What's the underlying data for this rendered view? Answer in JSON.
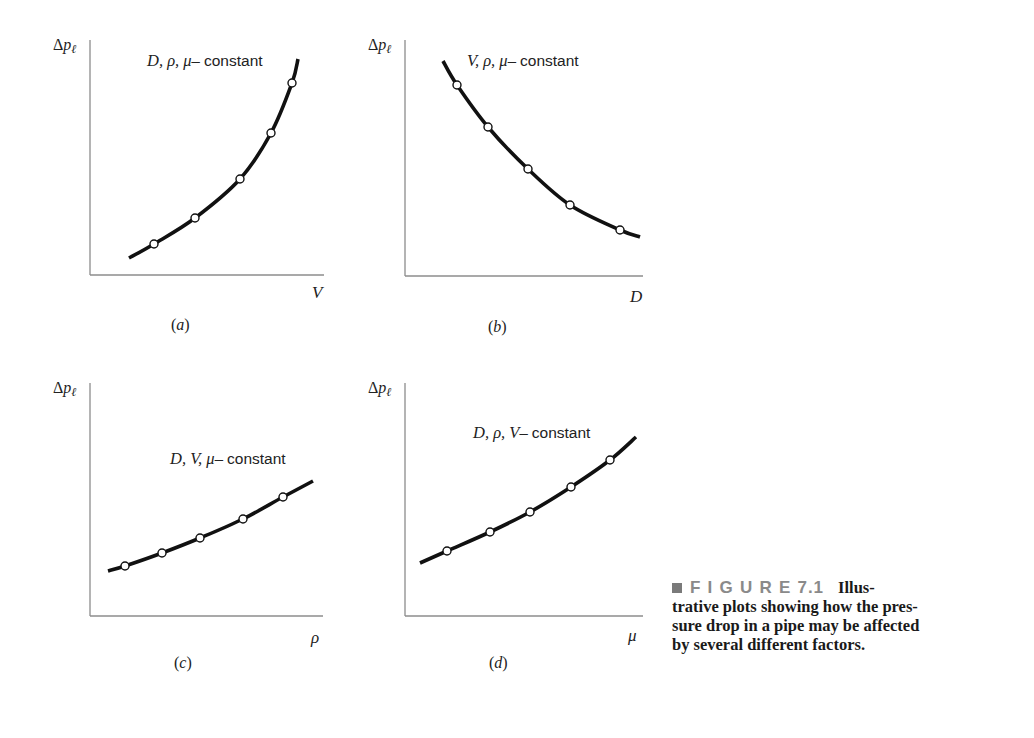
{
  "figure": {
    "label": "FIGURE",
    "number": "7.1",
    "caption_lines": [
      "Illus-",
      "trative plots showing how the pres-",
      "sure drop in a pipe may be affected",
      "by several different factors."
    ]
  },
  "style": {
    "curve_color": "#111111",
    "axis_color": "#8c8c8c",
    "marker_fill": "#ffffff",
    "caption_accent": "#8a8a8a"
  },
  "chart_data": [
    {
      "id": "a",
      "type": "line",
      "panel_label": "(a)",
      "title": "D, ρ, μ– constant",
      "title_italic": "D, ρ, μ–",
      "title_plain": "constant",
      "xlabel": "V",
      "ylabel": "Δpℓ",
      "grid": false,
      "ticks": false,
      "trend": "increasing, concave up (steep)",
      "curve_px": [
        [
          129,
          258
        ],
        [
          154,
          244
        ],
        [
          195,
          218
        ],
        [
          240,
          179
        ],
        [
          271,
          133
        ],
        [
          292,
          83
        ],
        [
          298,
          59
        ]
      ],
      "markers_px": [
        [
          154,
          244
        ],
        [
          195,
          218
        ],
        [
          240,
          179
        ],
        [
          271,
          133
        ],
        [
          292,
          83
        ]
      ],
      "x": [
        0.27,
        0.45,
        0.64,
        0.77,
        0.86
      ],
      "y": [
        0.13,
        0.24,
        0.41,
        0.6,
        0.82
      ],
      "axes_px": {
        "x0": 90,
        "y_top": 40,
        "y0": 275,
        "x_right": 324
      },
      "title_px": [
        147,
        66
      ],
      "xlabel_px": [
        312,
        298
      ],
      "ylabel_px": [
        53,
        50
      ],
      "panel_label_px": [
        171,
        330
      ]
    },
    {
      "id": "b",
      "type": "line",
      "panel_label": "(b)",
      "title": "V, ρ, μ– constant",
      "title_italic": "V, ρ, μ–",
      "title_plain": "constant",
      "xlabel": "D",
      "ylabel": "Δpℓ",
      "grid": false,
      "ticks": false,
      "trend": "decreasing, concave up",
      "curve_px": [
        [
          443,
          61
        ],
        [
          457,
          85
        ],
        [
          488,
          127
        ],
        [
          528,
          169
        ],
        [
          570,
          205
        ],
        [
          620,
          230
        ],
        [
          640,
          237
        ]
      ],
      "markers_px": [
        [
          457,
          85
        ],
        [
          488,
          127
        ],
        [
          528,
          169
        ],
        [
          570,
          205
        ],
        [
          620,
          230
        ]
      ],
      "x": [
        0.22,
        0.35,
        0.51,
        0.69,
        0.9
      ],
      "y": [
        0.82,
        0.64,
        0.46,
        0.3,
        0.2
      ],
      "axes_px": {
        "x0": 405,
        "y_top": 40,
        "y0": 276,
        "x_right": 643
      },
      "title_px": [
        467,
        66
      ],
      "xlabel_px": [
        630,
        302
      ],
      "ylabel_px": [
        368,
        50
      ],
      "panel_label_px": [
        488,
        332
      ]
    },
    {
      "id": "c",
      "type": "line",
      "panel_label": "(c)",
      "title": "D, V, μ– constant",
      "title_italic": "D, V, μ–",
      "title_plain": "constant",
      "xlabel": "ρ",
      "ylabel": "Δpℓ",
      "grid": false,
      "ticks": false,
      "trend": "increasing, slightly concave up",
      "curve_px": [
        [
          108,
          571
        ],
        [
          125,
          566
        ],
        [
          162,
          553
        ],
        [
          200,
          538
        ],
        [
          243,
          519
        ],
        [
          283,
          497
        ],
        [
          313,
          481
        ]
      ],
      "markers_px": [
        [
          125,
          566
        ],
        [
          162,
          553
        ],
        [
          200,
          538
        ],
        [
          243,
          519
        ],
        [
          283,
          497
        ]
      ],
      "x": [
        0.15,
        0.31,
        0.47,
        0.66,
        0.83
      ],
      "y": [
        0.21,
        0.27,
        0.33,
        0.41,
        0.51
      ],
      "axes_px": {
        "x0": 90,
        "y_top": 383,
        "y0": 616,
        "x_right": 323
      },
      "title_px": [
        170,
        464
      ],
      "xlabel_px": [
        311,
        643
      ],
      "ylabel_px": [
        53,
        393
      ],
      "panel_label_px": [
        174,
        668
      ]
    },
    {
      "id": "d",
      "type": "line",
      "panel_label": "(d)",
      "title": "D, ρ, V– constant",
      "title_italic": "D, ρ, V–",
      "title_plain": "constant",
      "xlabel": "μ",
      "ylabel": "Δpℓ",
      "grid": false,
      "ticks": false,
      "trend": "increasing, concave up",
      "curve_px": [
        [
          420,
          563
        ],
        [
          447,
          551
        ],
        [
          490,
          532
        ],
        [
          530,
          512
        ],
        [
          571,
          487
        ],
        [
          610,
          460
        ],
        [
          636,
          437
        ]
      ],
      "markers_px": [
        [
          447,
          551
        ],
        [
          490,
          532
        ],
        [
          530,
          512
        ],
        [
          571,
          487
        ],
        [
          610,
          460
        ]
      ],
      "x": [
        0.18,
        0.36,
        0.53,
        0.7,
        0.86
      ],
      "y": [
        0.28,
        0.36,
        0.45,
        0.55,
        0.67
      ],
      "axes_px": {
        "x0": 405,
        "y_top": 383,
        "y0": 616,
        "x_right": 643
      },
      "title_px": [
        473,
        438
      ],
      "xlabel_px": [
        628,
        641
      ],
      "ylabel_px": [
        368,
        393
      ],
      "panel_label_px": [
        489,
        668
      ]
    }
  ]
}
